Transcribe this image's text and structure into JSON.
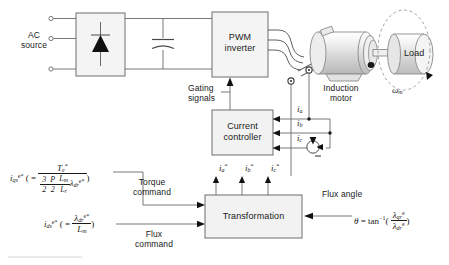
{
  "diagram": {
    "background": "#ffffff",
    "line_color": "#555555",
    "block_fill": "#f2f2f2"
  },
  "power_stage": {
    "ac_source_label_line1": "AC",
    "ac_source_label_line2": "source",
    "rectifier_name": "diode-rectifier",
    "dc_link_cap_name": "dc-link-capacitor",
    "inverter_label_line1": "PWM",
    "inverter_label_line2": "inverter",
    "gating_label_line1": "Gating",
    "gating_label_line2": "signals"
  },
  "machine": {
    "motor_label_line1": "Induction",
    "motor_label_line2": "motor",
    "load_label": "Load",
    "speed_symbol": "ω",
    "speed_subscript": "m"
  },
  "controller": {
    "current_controller_line1": "Current",
    "current_controller_line2": "controller",
    "transformation_label": "Transformation"
  },
  "feedback_currents": [
    {
      "symbol": "i",
      "sub": "a"
    },
    {
      "symbol": "i",
      "sub": "b"
    },
    {
      "symbol": "i",
      "sub": "c"
    }
  ],
  "command_currents": [
    {
      "symbol": "i",
      "sub": "a",
      "sup": "*"
    },
    {
      "symbol": "i",
      "sub": "b",
      "sup": "*"
    },
    {
      "symbol": "i",
      "sub": "c",
      "sup": "*"
    }
  ],
  "equations": {
    "torque": {
      "lhs_symbol": "i",
      "lhs_sub": "qs",
      "lhs_sup": "e*",
      "open": "( =",
      "numerator_symbol": "T",
      "numerator_sub": "e",
      "numerator_sup": "*",
      "den_f1_num": "3",
      "den_f1_den": "2",
      "den_f2_num": "P",
      "den_f2_den": "2",
      "den_f3_num": "L",
      "den_f3_num_sub": "m",
      "den_f3_den": "L",
      "den_f3_den_sub": "r",
      "den_tail_symbol": "λ",
      "den_tail_sub": "dr",
      "den_tail_sup": "e*",
      "close": ")",
      "command_label_line1": "Torque",
      "command_label_line2": "command"
    },
    "flux": {
      "lhs_symbol": "i",
      "lhs_sub": "ds",
      "lhs_sup": "e*",
      "open": "( =",
      "num_symbol": "λ",
      "num_sub": "dr",
      "num_sup": "e*",
      "den_symbol": "L",
      "den_sub": "m",
      "close": ")",
      "command_label_line1": "Flux",
      "command_label_line2": "command"
    },
    "flux_angle": {
      "title": "Flux angle",
      "theta": "θ",
      "equals": "=",
      "func": "tan",
      "func_sup": "−1",
      "open": "(",
      "num_symbol": "λ",
      "num_sub": "qr",
      "num_sup": "e",
      "den_symbol": "λ",
      "den_sub": "dr",
      "den_sup": "e",
      "close": ")"
    }
  }
}
